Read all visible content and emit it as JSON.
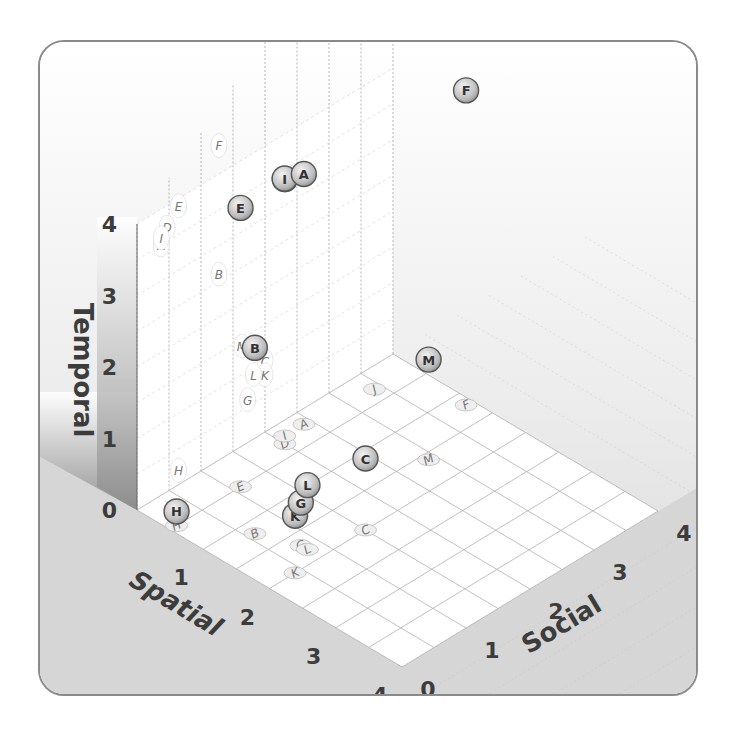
{
  "chart_data": {
    "type": "scatter",
    "subtype": "3d-scatter",
    "title": "",
    "axes": {
      "x": {
        "label": "Spatial",
        "ticks": [
          "0",
          "1",
          "2",
          "3",
          "4"
        ],
        "range": [
          0,
          4
        ]
      },
      "y": {
        "label": "Social",
        "ticks": [
          "0",
          "1",
          "2",
          "3",
          "4"
        ],
        "range": [
          0,
          4
        ]
      },
      "z": {
        "label": "Temporal",
        "ticks": [
          "0",
          "1",
          "2",
          "3",
          "4"
        ],
        "range": [
          0,
          4
        ]
      }
    },
    "grid": true,
    "legend": null,
    "projections": "floor and back-wall shadow labels shown for each point",
    "points": [
      {
        "label": "A",
        "spatial": 0.2,
        "social": 2.4,
        "temporal": 3.5
      },
      {
        "label": "B",
        "spatial": 1.2,
        "social": 0.6,
        "temporal": 2.6
      },
      {
        "label": "C",
        "spatial": 2.0,
        "social": 1.5,
        "temporal": 1.0
      },
      {
        "label": "D",
        "spatial": 0.3,
        "social": 2.0,
        "temporal": 3.7
      },
      {
        "label": "E",
        "spatial": 0.5,
        "social": 1.1,
        "temporal": 3.9
      },
      {
        "label": "F",
        "spatial": 1.2,
        "social": 3.9,
        "temporal": 4.4
      },
      {
        "label": "G",
        "spatial": 1.7,
        "social": 0.8,
        "temporal": 0.6
      },
      {
        "label": "H",
        "spatial": 0.5,
        "social": 0.1,
        "temporal": 0.2
      },
      {
        "label": "I",
        "spatial": 0.2,
        "social": 2.1,
        "temporal": 3.6
      },
      {
        "label": "J",
        "spatial": 0.3,
        "social": 3.4,
        "temporal": 5.4
      },
      {
        "label": "K",
        "spatial": 2.0,
        "social": 0.4,
        "temporal": 0.8
      },
      {
        "label": "L",
        "spatial": 1.8,
        "social": 0.8,
        "temporal": 0.9
      },
      {
        "label": "M",
        "spatial": 1.6,
        "social": 2.9,
        "temporal": 1.4
      }
    ]
  },
  "geometry": {
    "origin": [
      135,
      508
    ],
    "spatial_unit": [
      66.25,
      39.25
    ],
    "social_unit": [
      64,
      -39
    ],
    "temporal_unit": -71.5
  },
  "colors": {
    "floor": "#ffffff",
    "ground": "#d6d6d6",
    "wall_grad_top": "#ffffff",
    "wall_grad_bottom": "#8c8c8c",
    "grid": "#b0b0b0",
    "point_fill": "#bdbdbd",
    "point_stroke": "#555555",
    "text": "#3c3c3c"
  }
}
